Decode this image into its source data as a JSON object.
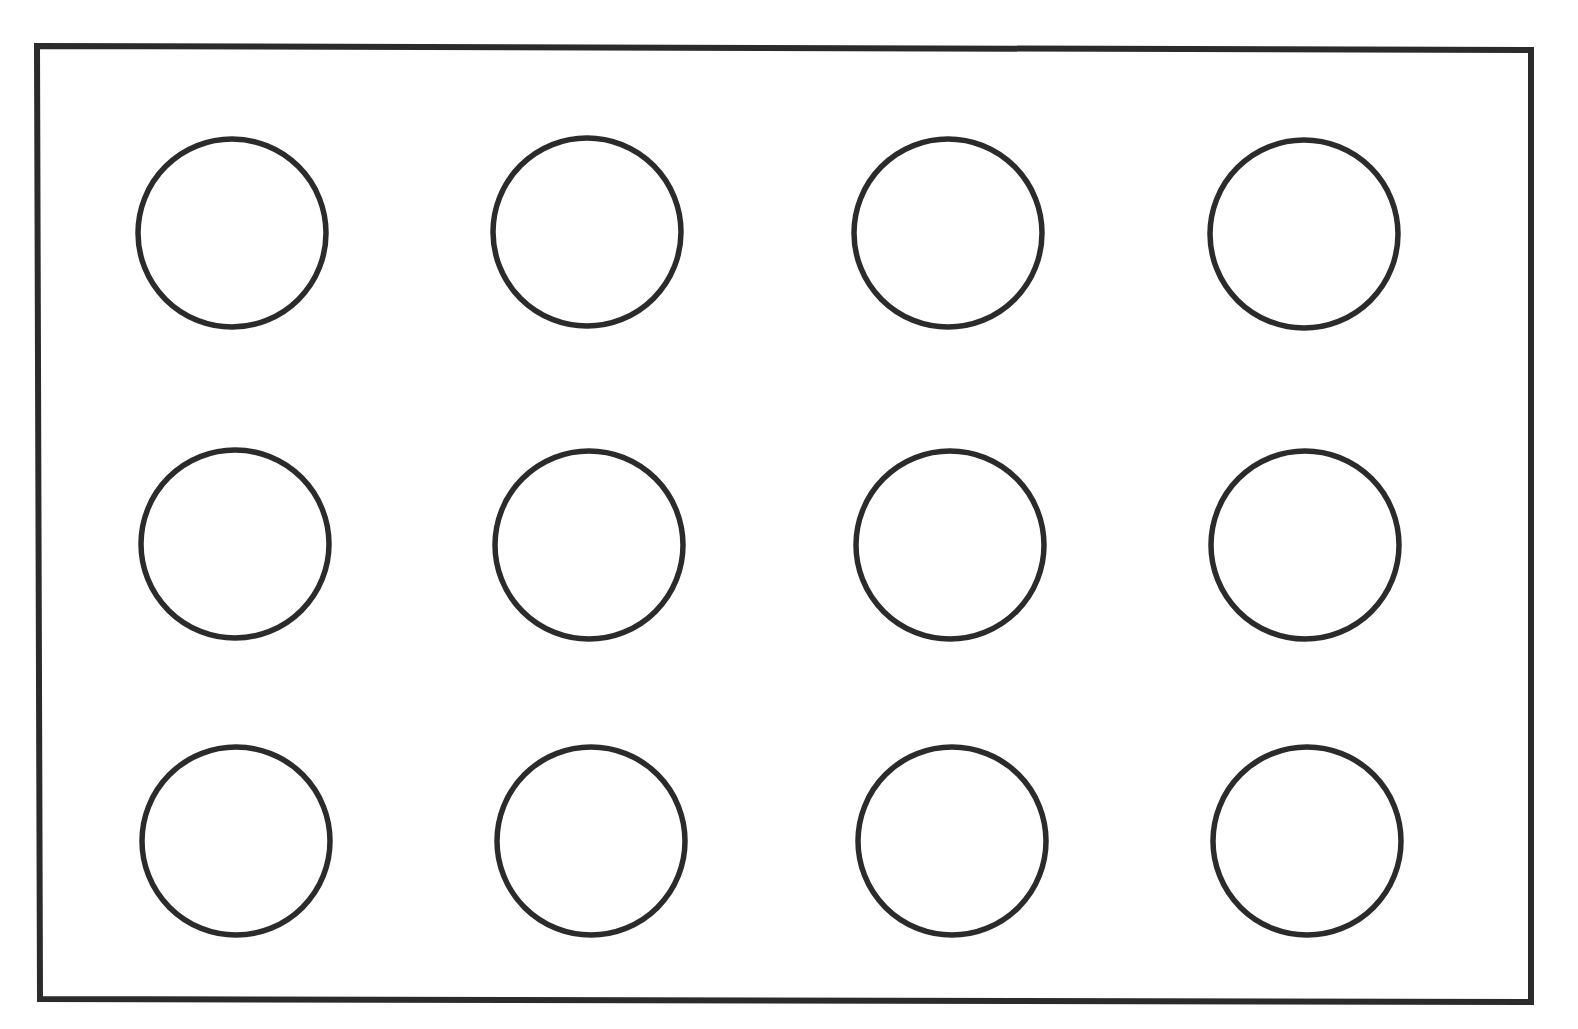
{
  "diagram": {
    "stroke_color": "#2b2b2b",
    "background": "#ffffff",
    "frame": {
      "corners": [
        [
          37,
          46
        ],
        [
          1531,
          50
        ],
        [
          1531,
          1002
        ],
        [
          40,
          999
        ]
      ],
      "stroke_width": 6
    },
    "circle_radius": 94,
    "circle_stroke_width": 5.5,
    "rows": 3,
    "cols": 4,
    "circles": [
      {
        "row": 1,
        "col": 1,
        "cx": 232,
        "cy": 233
      },
      {
        "row": 1,
        "col": 2,
        "cx": 587,
        "cy": 232
      },
      {
        "row": 1,
        "col": 3,
        "cx": 948,
        "cy": 233
      },
      {
        "row": 1,
        "col": 4,
        "cx": 1304,
        "cy": 234
      },
      {
        "row": 2,
        "col": 1,
        "cx": 235,
        "cy": 544
      },
      {
        "row": 2,
        "col": 2,
        "cx": 589,
        "cy": 545
      },
      {
        "row": 2,
        "col": 3,
        "cx": 950,
        "cy": 545
      },
      {
        "row": 2,
        "col": 4,
        "cx": 1305,
        "cy": 545
      },
      {
        "row": 3,
        "col": 1,
        "cx": 236,
        "cy": 841
      },
      {
        "row": 3,
        "col": 2,
        "cx": 591,
        "cy": 841
      },
      {
        "row": 3,
        "col": 3,
        "cx": 952,
        "cy": 841
      },
      {
        "row": 3,
        "col": 4,
        "cx": 1307,
        "cy": 841
      }
    ]
  }
}
